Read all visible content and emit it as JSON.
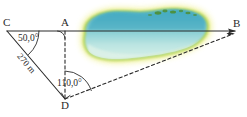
{
  "figure": {
    "points": [
      {
        "id": "C",
        "label": "C",
        "x": 7,
        "y": 31
      },
      {
        "id": "A",
        "label": "A",
        "x": 65,
        "y": 31
      },
      {
        "id": "B",
        "label": "B",
        "x": 233,
        "y": 31
      },
      {
        "id": "D",
        "label": "D",
        "x": 65,
        "y": 99
      }
    ],
    "point_labels": [
      {
        "name": "point-label-c",
        "text": "C",
        "left": 3,
        "top": 18
      },
      {
        "name": "point-label-a",
        "text": "A",
        "left": 61,
        "top": 18
      },
      {
        "name": "point-label-b",
        "text": "B",
        "left": 232,
        "top": 19
      },
      {
        "name": "point-label-d",
        "text": "D",
        "left": 61,
        "top": 101
      }
    ],
    "angles": [
      {
        "name": "angle-at-c",
        "text": "50,0°",
        "left": 18,
        "top": 35,
        "vertex": "C"
      },
      {
        "name": "angle-at-d",
        "text": "110,0°",
        "left": 57,
        "top": 78,
        "vertex": "D"
      }
    ],
    "lengths": [
      {
        "name": "side-length-cd",
        "text": "270 m",
        "left": 22,
        "top": 54,
        "rotation": 49
      }
    ],
    "right_angle_marker": {
      "name": "right-angle-at-a",
      "vertex": "A"
    },
    "segments": [
      {
        "name": "segment-c-b",
        "from": "C",
        "to": "B",
        "style": "solid",
        "arrow": true
      },
      {
        "name": "segment-c-d",
        "from": "C",
        "to": "D",
        "style": "solid",
        "arrow": false
      },
      {
        "name": "segment-a-d",
        "from": "A",
        "to": "D",
        "style": "dashed",
        "arrow": false
      },
      {
        "name": "segment-d-b",
        "from": "D",
        "to": "B",
        "style": "dashed",
        "arrow": true
      }
    ],
    "lake": {
      "name": "lake-shape",
      "water_top_color": "#63b9cb",
      "water_bottom_color": "#c2e7e4",
      "shore_color": "#b9d755",
      "halo_color": "#f0ef86",
      "vegetation_color": "#4c8c2b"
    },
    "line_color": "#2a2a2a",
    "background_color": "#ffffff"
  }
}
